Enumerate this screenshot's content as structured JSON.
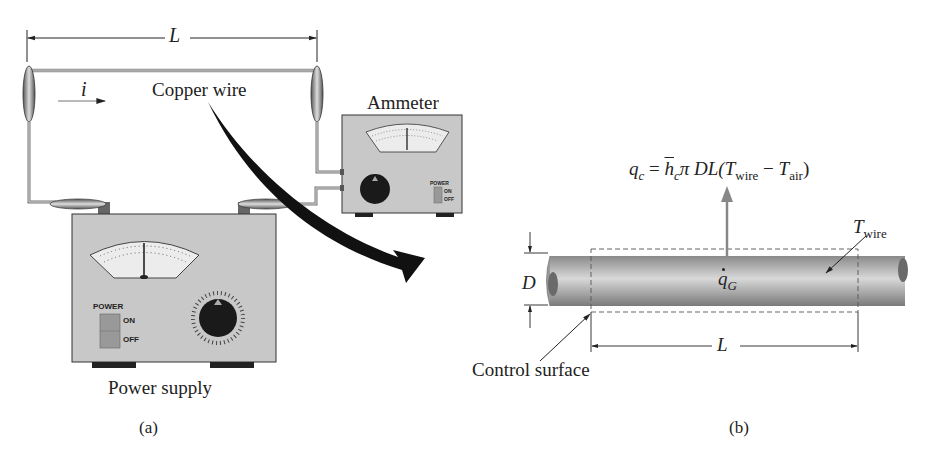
{
  "panel_a": {
    "caption": "(a)",
    "length_label": "L",
    "current_label": "i",
    "wire_label": "Copper wire",
    "ammeter": {
      "label": "Ammeter",
      "power_label": "POWER",
      "on_label": "ON",
      "off_label": "OFF"
    },
    "power_supply": {
      "label": "Power supply",
      "power_label": "POWER",
      "on_label": "ON",
      "off_label": "OFF"
    }
  },
  "panel_b": {
    "caption": "(b)",
    "equation": {
      "lhs": "q",
      "lhs_sub": "c",
      "eq": " = ",
      "h": "h",
      "h_sub": "c",
      "pi_dl": "π DL(",
      "t1": "T",
      "t1_sub": "wire",
      "minus": " − ",
      "t2": "T",
      "t2_sub": "air",
      "close": ")"
    },
    "twire_label": "T",
    "twire_sub": "wire",
    "generation_label": "q",
    "generation_sub": "G",
    "diameter_label": "D",
    "length_label": "L",
    "control_surface_label": "Control surface"
  },
  "colors": {
    "ink": "#222222",
    "device_body": "#c8c8c8",
    "meter_face": "#ececec",
    "arrow_gray": "#8a8a8a",
    "wire_dark": "#7a7a7a",
    "wire_light": "#d6d6d6"
  }
}
